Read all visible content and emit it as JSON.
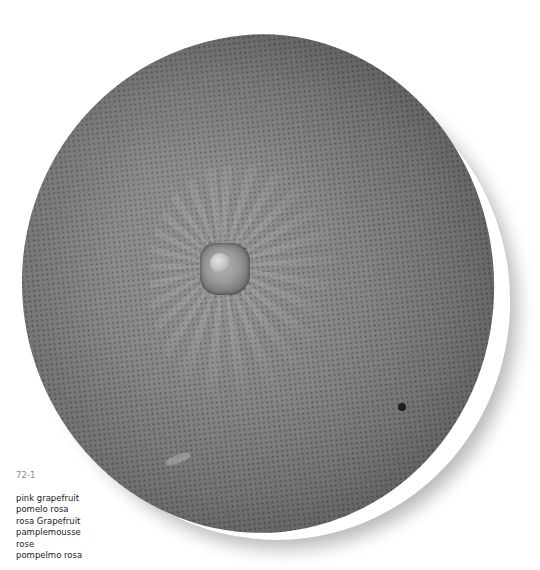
{
  "photo": {
    "subject": "pink grapefruit",
    "colors": {
      "background": "#ffffff",
      "fruit_center": "#8f8f8f",
      "fruit_edge": "#2e2e2e",
      "stem_highlight": "#e4e4e4",
      "caption_id": "#8a8a8a",
      "caption_text": "#222222"
    }
  },
  "caption": {
    "id": "72-1",
    "names": [
      "pink grapefruit",
      "pomelo rosa",
      "rosa Grapefruit",
      "pamplemousse",
      "rose",
      "pompelmo rosa"
    ]
  }
}
